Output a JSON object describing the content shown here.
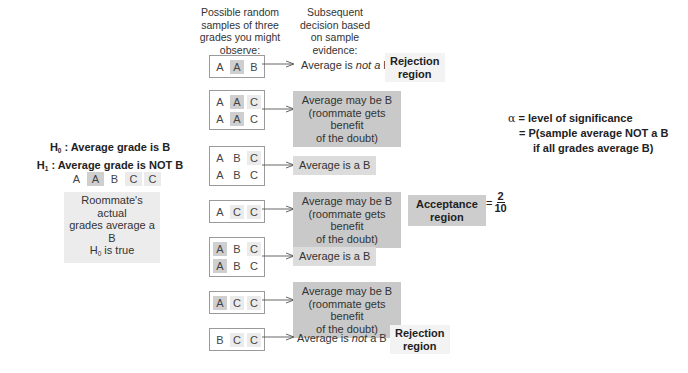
{
  "headers": {
    "samples": [
      "Possible random",
      "samples of three",
      "grades you might",
      "observe:"
    ],
    "decision": [
      "Subsequent",
      "decision based",
      "on sample",
      "evidence:"
    ]
  },
  "hypotheses": {
    "h0_label": "H",
    "h0_sub": "0",
    "h0_text": " : Average grade is B",
    "h1_label": "H",
    "h1_sub": "1",
    "h1_text": " : Average grade is NOT  B",
    "grades": [
      {
        "letter": "A",
        "shade": "none"
      },
      {
        "letter": "A",
        "shade": "dark"
      },
      {
        "letter": "B",
        "shade": "none"
      },
      {
        "letter": "C",
        "shade": "light"
      },
      {
        "letter": "C",
        "shade": "light"
      }
    ],
    "truth_line1": "Roommate's actual",
    "truth_line2": "grades average a B",
    "truth_line3_pre": "H",
    "truth_line3_sub": "0",
    "truth_line3_post": " is true"
  },
  "samples": [
    {
      "rows": [
        [
          {
            "l": "A",
            "s": "none"
          },
          {
            "l": "A",
            "s": "dark"
          },
          {
            "l": "B",
            "s": "none"
          }
        ]
      ],
      "decision": {
        "pre": "Average is ",
        "em": "not a",
        "post": " B",
        "style": "plain"
      },
      "region": "Rejection region"
    },
    {
      "rows": [
        [
          {
            "l": "A",
            "s": "none"
          },
          {
            "l": "A",
            "s": "dark"
          },
          {
            "l": "C",
            "s": "light"
          }
        ],
        [
          {
            "l": "A",
            "s": "none"
          },
          {
            "l": "A",
            "s": "dark"
          },
          {
            "l": "C",
            "s": "none"
          }
        ]
      ],
      "decision": {
        "lines": [
          "Average may be B",
          "(roommate gets benefit",
          "of the doubt)"
        ],
        "style": "grey"
      }
    },
    {
      "rows": [
        [
          {
            "l": "A",
            "s": "none"
          },
          {
            "l": "B",
            "s": "none"
          },
          {
            "l": "C",
            "s": "light"
          }
        ],
        [
          {
            "l": "A",
            "s": "none"
          },
          {
            "l": "B",
            "s": "none"
          },
          {
            "l": "C",
            "s": "none"
          }
        ]
      ],
      "decision": {
        "text": "Average is a B",
        "style": "light"
      }
    },
    {
      "rows": [
        [
          {
            "l": "A",
            "s": "none"
          },
          {
            "l": "C",
            "s": "light"
          },
          {
            "l": "C",
            "s": "light"
          }
        ]
      ],
      "decision": {
        "lines": [
          "Average may be B",
          "(roommate gets benefit",
          "of the doubt)"
        ],
        "style": "grey"
      },
      "region": "Acceptance region"
    },
    {
      "rows": [
        [
          {
            "l": "A",
            "s": "dark"
          },
          {
            "l": "B",
            "s": "none"
          },
          {
            "l": "C",
            "s": "light"
          }
        ],
        [
          {
            "l": "A",
            "s": "dark"
          },
          {
            "l": "B",
            "s": "none"
          },
          {
            "l": "C",
            "s": "none"
          }
        ]
      ],
      "decision": {
        "text": "Average is a B",
        "style": "light"
      }
    },
    {
      "rows": [
        [
          {
            "l": "A",
            "s": "dark"
          },
          {
            "l": "C",
            "s": "light"
          },
          {
            "l": "C",
            "s": "light"
          }
        ]
      ],
      "decision": {
        "lines": [
          "Average may be B",
          "(roommate gets benefit",
          "of the doubt)"
        ],
        "style": "grey"
      }
    },
    {
      "rows": [
        [
          {
            "l": "B",
            "s": "none"
          },
          {
            "l": "C",
            "s": "light"
          },
          {
            "l": "C",
            "s": "light"
          }
        ]
      ],
      "decision": {
        "pre": "Average is ",
        "em": "not",
        "post": " a B",
        "style": "plain"
      },
      "region": "Rejection region"
    }
  ],
  "regions": {
    "rejection_top": [
      "Rejection",
      "region"
    ],
    "acceptance": [
      "Acceptance",
      "region"
    ],
    "rejection_bottom": [
      "Rejection",
      "region"
    ]
  },
  "fraction": {
    "eq": "=",
    "numerator": "2",
    "denominator": "10"
  },
  "alpha": {
    "symbol": "α",
    "line1": " = level of significance",
    "line2": "= P(sample average NOT a B",
    "line3": "if all grades average B)"
  },
  "colors": {
    "dark_highlight": "#cfcfcf",
    "light_highlight": "#ebebeb",
    "decision_grey": "#c9c9c9",
    "decision_light": "#dcdcdc",
    "box_border": "#9a9a9a"
  }
}
